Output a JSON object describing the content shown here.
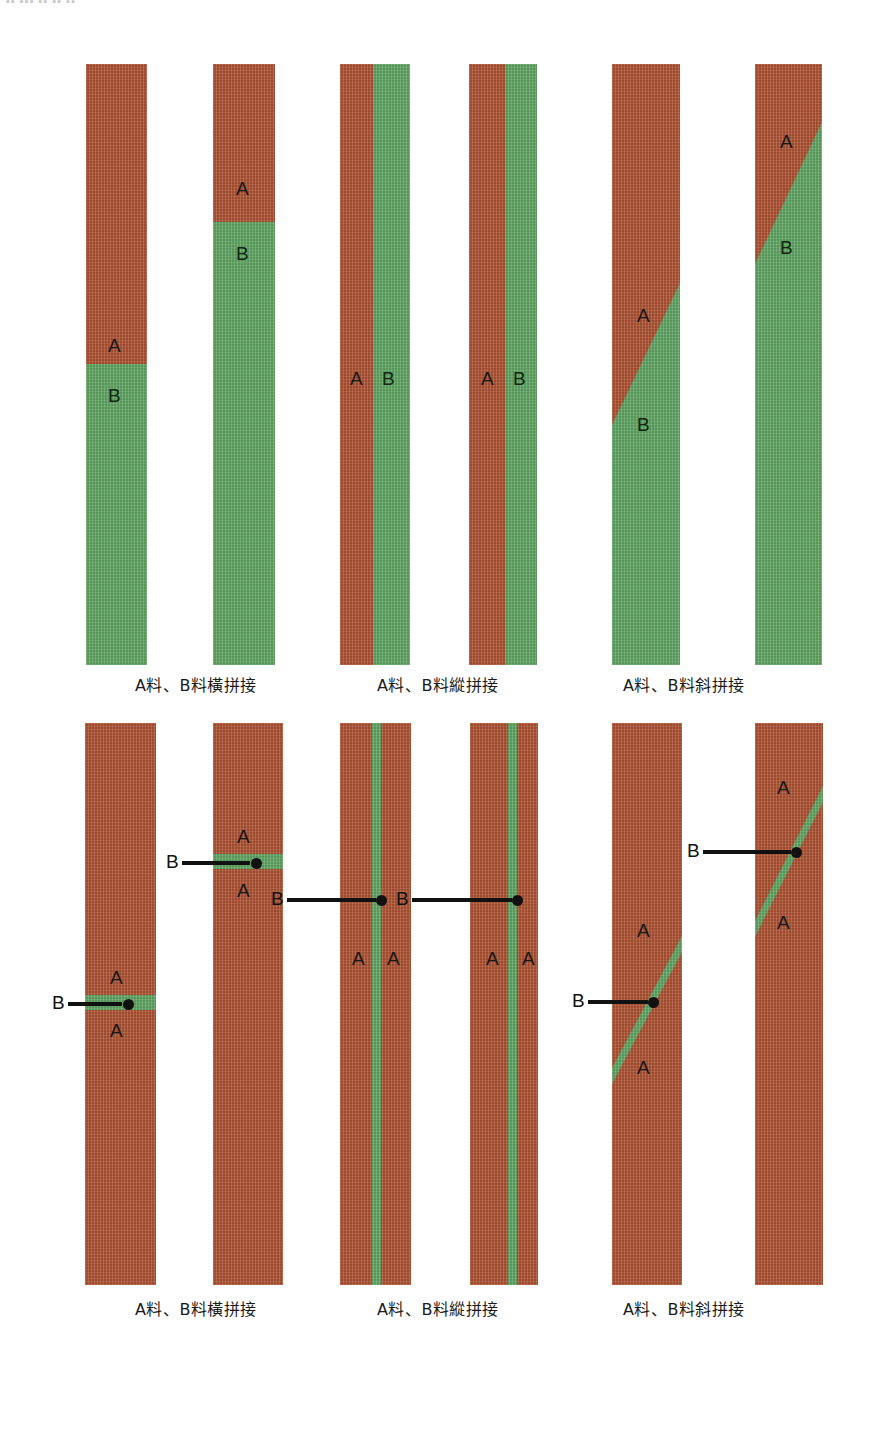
{
  "page": {
    "top_edge_text": "▪▪ ▪▪▪ ▪▪  ▪▪  ▪▪",
    "colors": {
      "fabric_a_red": "#b05434",
      "fabric_b_green": "#62a765",
      "callout_black": "#111111",
      "background": "#ffffff"
    }
  },
  "labels": {
    "a": "A",
    "b": "B"
  },
  "rows": [
    {
      "id": "row-top",
      "groups": [
        {
          "id": "group-horizontal-join-top",
          "caption": "A料、B料橫拼接",
          "caption_x": 196,
          "caption_y": 672,
          "strips": [
            {
              "id": "strip-1",
              "type": "horizontal-split",
              "x": 86,
              "y": 64,
              "w": 61,
              "h": 601,
              "split_y": 300,
              "top_color": "red",
              "bottom_color": "green",
              "marks": [
                {
                  "text": "A",
                  "x": 22,
                  "y": 272,
                  "on": "red"
                },
                {
                  "text": "B",
                  "x": 22,
                  "y": 322,
                  "on": "green"
                }
              ]
            },
            {
              "id": "strip-2",
              "type": "horizontal-split",
              "x": 213,
              "y": 64,
              "w": 62,
              "h": 601,
              "split_y": 158,
              "top_color": "red",
              "bottom_color": "green",
              "marks": [
                {
                  "text": "A",
                  "x": 23,
                  "y": 115,
                  "on": "red"
                },
                {
                  "text": "B",
                  "x": 23,
                  "y": 180,
                  "on": "green"
                }
              ]
            }
          ]
        },
        {
          "id": "group-vertical-join-top",
          "caption": "A料、B料縱拼接",
          "caption_x": 438,
          "caption_y": 672,
          "strips": [
            {
              "id": "strip-3",
              "type": "vertical-split",
              "x": 340,
              "y": 64,
              "w": 70,
              "h": 601,
              "split_x": 33,
              "left_color": "red",
              "right_color": "green",
              "marks": [
                {
                  "text": "A",
                  "x": 10,
                  "y": 305,
                  "on": "red"
                },
                {
                  "text": "B",
                  "x": 42,
                  "y": 305,
                  "on": "green"
                }
              ]
            },
            {
              "id": "strip-4",
              "type": "vertical-split",
              "x": 469,
              "y": 64,
              "w": 68,
              "h": 601,
              "split_x": 36,
              "left_color": "red",
              "right_color": "green",
              "marks": [
                {
                  "text": "A",
                  "x": 12,
                  "y": 305,
                  "on": "red"
                },
                {
                  "text": "B",
                  "x": 44,
                  "y": 305,
                  "on": "green"
                }
              ]
            }
          ]
        },
        {
          "id": "group-diagonal-join-top",
          "caption": "A料、B料斜拼接",
          "caption_x": 684,
          "caption_y": 672,
          "strips": [
            {
              "id": "strip-5",
              "type": "diagonal-split",
              "x": 612,
              "y": 64,
              "w": 68,
              "h": 601,
              "diag_top_right_y": 219,
              "diag_bottom_left_y": 361,
              "upper_color": "red",
              "lower_color": "green",
              "marks": [
                {
                  "text": "A",
                  "x": 25,
                  "y": 242,
                  "on": "red"
                },
                {
                  "text": "B",
                  "x": 25,
                  "y": 351,
                  "on": "green"
                }
              ]
            },
            {
              "id": "strip-6",
              "type": "diagonal-split",
              "x": 755,
              "y": 64,
              "w": 67,
              "h": 601,
              "diag_top_right_y": 58,
              "diag_bottom_left_y": 200,
              "upper_color": "red",
              "lower_color": "green",
              "marks": [
                {
                  "text": "A",
                  "x": 25,
                  "y": 68,
                  "on": "red"
                },
                {
                  "text": "B",
                  "x": 25,
                  "y": 174,
                  "on": "green"
                }
              ]
            }
          ]
        }
      ]
    },
    {
      "id": "row-bottom",
      "groups": [
        {
          "id": "group-horizontal-join-bottom",
          "caption": "A料、B料橫拼接",
          "caption_x": 196,
          "caption_y": 1296,
          "strips": [
            {
              "id": "strip-7",
              "type": "horizontal-band",
              "x": 85,
              "y": 723,
              "w": 71,
              "h": 562,
              "band_y": 272,
              "band_h": 15,
              "base_color": "red",
              "band_color": "green",
              "marks": [
                {
                  "text": "A",
                  "x": 25,
                  "y": 245,
                  "on": "red"
                },
                {
                  "text": "A",
                  "x": 25,
                  "y": 298,
                  "on": "red"
                }
              ],
              "callout": {
                "label": "B",
                "label_x": -33,
                "line_x": -17,
                "line_y": 279,
                "line_w": 54,
                "dot_x": 38
              }
            },
            {
              "id": "strip-8",
              "type": "horizontal-band",
              "x": 213,
              "y": 723,
              "w": 70,
              "h": 562,
              "band_y": 131,
              "band_h": 15,
              "base_color": "red",
              "band_color": "green",
              "marks": [
                {
                  "text": "A",
                  "x": 24,
                  "y": 104,
                  "on": "red"
                },
                {
                  "text": "A",
                  "x": 24,
                  "y": 158,
                  "on": "red"
                }
              ],
              "callout": {
                "label": "B",
                "label_x": -47,
                "line_x": -31,
                "line_y": 138,
                "line_w": 68,
                "dot_x": 38
              }
            }
          ]
        },
        {
          "id": "group-vertical-join-bottom",
          "caption": "A料、B料縱拼接",
          "caption_x": 438,
          "caption_y": 1296,
          "strips": [
            {
              "id": "strip-9",
              "type": "vertical-band",
              "x": 340,
              "y": 723,
              "w": 71,
              "h": 562,
              "band_x": 32,
              "band_w": 9,
              "base_color": "red",
              "band_color": "green",
              "marks": [
                {
                  "text": "A",
                  "x": 12,
                  "y": 226,
                  "on": "red"
                },
                {
                  "text": "A",
                  "x": 47,
                  "y": 226,
                  "on": "red"
                }
              ],
              "callout": {
                "label": "B",
                "label_x": -69,
                "line_x": -53,
                "line_y": 175,
                "line_w": 89,
                "dot_x": 36
              }
            },
            {
              "id": "strip-10",
              "type": "vertical-band",
              "x": 470,
              "y": 723,
              "w": 68,
              "h": 562,
              "band_x": 38,
              "band_w": 9,
              "base_color": "red",
              "band_color": "green",
              "marks": [
                {
                  "text": "A",
                  "x": 16,
                  "y": 226,
                  "on": "red"
                },
                {
                  "text": "A",
                  "x": 52,
                  "y": 226,
                  "on": "red"
                }
              ],
              "callout": {
                "label": "B",
                "label_x": -74,
                "line_x": -58,
                "line_y": 175,
                "line_w": 100,
                "dot_x": 42
              }
            }
          ]
        },
        {
          "id": "group-diagonal-join-bottom",
          "caption": "A料、B料斜拼接",
          "caption_x": 684,
          "caption_y": 1296,
          "strips": [
            {
              "id": "strip-11",
              "type": "diagonal-band",
              "x": 612,
              "y": 723,
              "w": 70,
              "h": 562,
              "band_top_right_y": 213,
              "band_bottom_left_y": 345,
              "band_thickness": 16,
              "base_color": "red",
              "band_color": "green",
              "marks": [
                {
                  "text": "A",
                  "x": 25,
                  "y": 198,
                  "on": "red"
                },
                {
                  "text": "A",
                  "x": 25,
                  "y": 335,
                  "on": "red"
                }
              ],
              "callout": {
                "label": "B",
                "label_x": -40,
                "line_x": -24,
                "line_y": 277,
                "line_w": 60,
                "dot_x": 36
              }
            },
            {
              "id": "strip-12",
              "type": "diagonal-band",
              "x": 755,
              "y": 723,
              "w": 68,
              "h": 562,
              "band_top_right_y": 63,
              "band_bottom_left_y": 198,
              "band_thickness": 16,
              "base_color": "red",
              "band_color": "green",
              "marks": [
                {
                  "text": "A",
                  "x": 22,
                  "y": 55,
                  "on": "red"
                },
                {
                  "text": "A",
                  "x": 22,
                  "y": 190,
                  "on": "red"
                }
              ],
              "callout": {
                "label": "B",
                "label_x": -68,
                "line_x": -52,
                "line_y": 127,
                "line_w": 88,
                "dot_x": 36
              }
            }
          ]
        }
      ]
    }
  ]
}
